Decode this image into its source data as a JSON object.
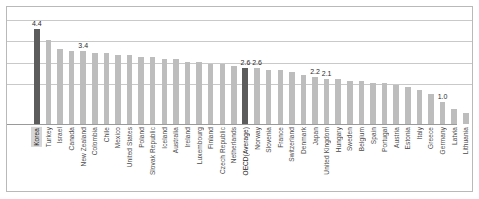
{
  "unit_note": "단위: %",
  "chart_data": {
    "type": "bar",
    "title": "",
    "subtitle": "",
    "xlabel": "",
    "ylabel": "",
    "unit": "%",
    "ylim": [
      0,
      4.6
    ],
    "grid": true,
    "gridlines": [
      4.0,
      3.0,
      2.0,
      1.0
    ],
    "legend": [],
    "legend_position": "none",
    "highlight_color": "#5c5c5c",
    "bar_color": "#bdbdbd",
    "categories": [
      "Korea",
      "Turkey",
      "Israel",
      "Canada",
      "New Zealand",
      "Colombia",
      "Chile",
      "Mexico",
      "United States",
      "Poland",
      "Slovak Republic",
      "Iceland",
      "Australia",
      "Ireland",
      "Luxembourg",
      "Finland",
      "Czech Republic",
      "Netherlands",
      "OECD(Average)",
      "Norway",
      "Slovenia",
      "France",
      "Switzerland",
      "Denmark",
      "Japan",
      "United Kingdom",
      "Hungary",
      "Sweden",
      "Belgium",
      "Spain",
      "Portugal",
      "Austria",
      "Estonia",
      "Italy",
      "Greece",
      "Germany",
      "Latvia",
      "Lithuania"
    ],
    "values": [
      4.4,
      3.9,
      3.5,
      3.4,
      3.4,
      3.3,
      3.3,
      3.2,
      3.2,
      3.1,
      3.1,
      3.0,
      3.0,
      2.9,
      2.9,
      2.8,
      2.8,
      2.7,
      2.6,
      2.6,
      2.5,
      2.5,
      2.4,
      2.3,
      2.2,
      2.1,
      2.1,
      2.0,
      2.0,
      1.9,
      1.9,
      1.8,
      1.7,
      1.6,
      1.4,
      1.0,
      0.7,
      0.5
    ],
    "highlighted": [
      "Korea",
      "OECD(Average)"
    ],
    "data_labels": [
      {
        "category": "Korea",
        "text": "4.4"
      },
      {
        "category": "New Zealand",
        "text": "3.4"
      },
      {
        "category": "OECD(Average)",
        "text": "2.6"
      },
      {
        "category": "Norway",
        "text": "2.6"
      },
      {
        "category": "Japan",
        "text": "2.2"
      },
      {
        "category": "United Kingdom",
        "text": "2.1"
      },
      {
        "category": "Germany",
        "text": "1.0"
      }
    ]
  }
}
